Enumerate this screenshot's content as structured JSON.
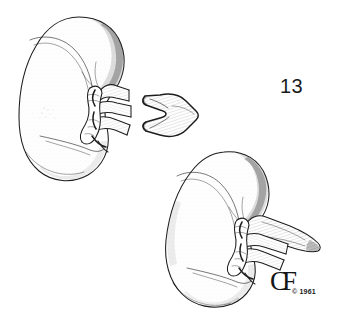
{
  "plate": {
    "number": "13",
    "background_color": "#ffffff",
    "ink_color": "#1d1d1d",
    "width": 337,
    "height": 334
  },
  "signature": {
    "monogram": "CF",
    "copyright": "© 1961"
  },
  "figures": [
    {
      "id": "upper-left-kidney",
      "name": "kidney-superior-left",
      "description": "Kidney shown in anterior view with hilar vessels and ureter stump directed to the right",
      "position": {
        "x": 18,
        "y": 16,
        "width": 125,
        "height": 170
      }
    },
    {
      "id": "detached-vessel",
      "name": "renal-vessel-segment",
      "description": "Isolated branching renal vessel segment with three-pronged division",
      "position": {
        "x": 137,
        "y": 92,
        "width": 62,
        "height": 44
      }
    },
    {
      "id": "lower-right-kidney",
      "name": "kidney-inferior-right",
      "description": "Kidney shown obliquely with hilar vessels and elongated ureter extending to the right",
      "position": {
        "x": 160,
        "y": 150,
        "width": 160,
        "height": 155
      }
    }
  ],
  "labels": {
    "plate_number_label": "13",
    "copyright_label": "© 1961",
    "monogram_label": "CF"
  }
}
